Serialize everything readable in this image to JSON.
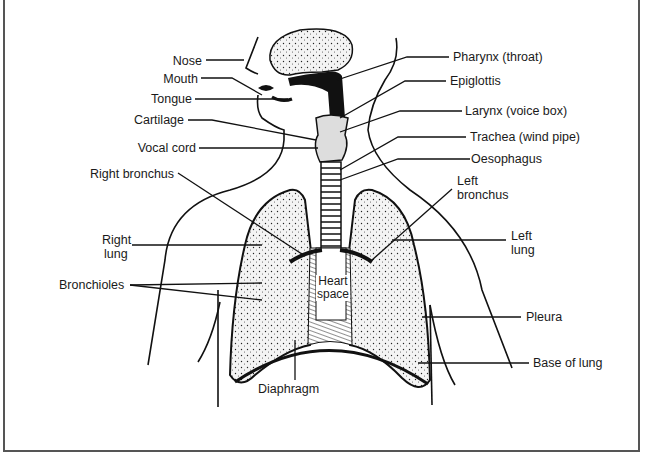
{
  "diagram": {
    "labels_left": [
      {
        "key": "nose",
        "text": "Nose"
      },
      {
        "key": "mouth",
        "text": "Mouth"
      },
      {
        "key": "tongue",
        "text": "Tongue"
      },
      {
        "key": "cartilage",
        "text": "Cartilage"
      },
      {
        "key": "vocal_cord",
        "text": "Vocal cord"
      },
      {
        "key": "right_bronchus",
        "text": "Right bronchus"
      },
      {
        "key": "right_lung_1",
        "text": "Right"
      },
      {
        "key": "right_lung_2",
        "text": "lung"
      },
      {
        "key": "bronchioles",
        "text": "Bronchioles"
      }
    ],
    "labels_right": [
      {
        "key": "pharynx",
        "text": "Pharynx (throat)"
      },
      {
        "key": "epiglottis",
        "text": "Epiglottis"
      },
      {
        "key": "larynx",
        "text": "Larynx (voice box)"
      },
      {
        "key": "trachea",
        "text": "Trachea (wind pipe)"
      },
      {
        "key": "oesophagus",
        "text": "Oesophagus"
      },
      {
        "key": "left_bronchus_1",
        "text": "Left"
      },
      {
        "key": "left_bronchus_2",
        "text": "bronchus"
      },
      {
        "key": "left_lung_1",
        "text": "Left"
      },
      {
        "key": "left_lung_2",
        "text": "lung"
      },
      {
        "key": "pleura",
        "text": "Pleura"
      },
      {
        "key": "base_of_lung",
        "text": "Base of lung"
      }
    ],
    "labels_center": [
      {
        "key": "heart_1",
        "text": "Heart"
      },
      {
        "key": "heart_2",
        "text": "space"
      },
      {
        "key": "diaphragm",
        "text": "Diaphragm"
      }
    ],
    "colors": {
      "ink": "#111111",
      "lung_fill": "#f2f2f2",
      "frame": "#555555"
    }
  }
}
